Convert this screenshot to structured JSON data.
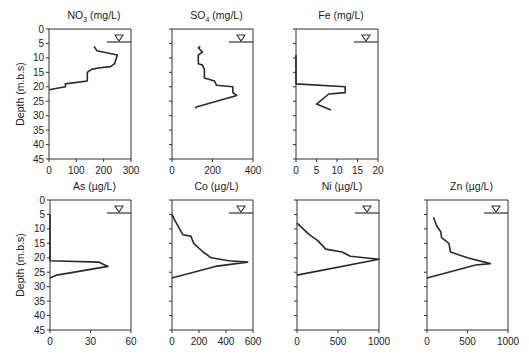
{
  "figure": {
    "ylabel": "Depth (m.b.s)",
    "y_ticks": [
      0,
      5,
      10,
      15,
      20,
      25,
      30,
      35,
      40,
      45
    ],
    "water_table_depth": 4.5
  },
  "chart_data": [
    {
      "type": "line",
      "title": "NO3 (mg/L)",
      "title_main": "NO",
      "title_sub": "3",
      "title_rest": " (mg/L)",
      "xlabel": "",
      "ylabel": "Depth (m.b.s)",
      "xlim": [
        0,
        300
      ],
      "ylim": [
        45,
        0
      ],
      "x_ticks": [
        0,
        100,
        200,
        300
      ],
      "y_ticks": [
        0,
        5,
        10,
        15,
        20,
        25,
        30,
        35,
        40,
        45
      ],
      "show_y_labels": true,
      "frame": {
        "x0": 49,
        "x1": 131,
        "y0": 29,
        "y1": 159
      },
      "points": [
        [
          165,
          6
        ],
        [
          175,
          7.5
        ],
        [
          250,
          9
        ],
        [
          240,
          12
        ],
        [
          225,
          13
        ],
        [
          180,
          13.5
        ],
        [
          155,
          14
        ],
        [
          140,
          15
        ],
        [
          140,
          18
        ],
        [
          60,
          19
        ],
        [
          60,
          20
        ],
        [
          0,
          21
        ]
      ]
    },
    {
      "type": "line",
      "title": "SO4 (mg/L)",
      "title_main": "SO",
      "title_sub": "4",
      "title_rest": " (mg/L)",
      "xlim": [
        0,
        400
      ],
      "ylim": [
        45,
        0
      ],
      "x_ticks": [
        0,
        200,
        400
      ],
      "y_ticks": [
        0,
        5,
        10,
        15,
        20,
        25,
        30,
        35,
        40,
        45
      ],
      "show_y_labels": false,
      "frame": {
        "x0": 172,
        "x1": 253,
        "y0": 29,
        "y1": 159
      },
      "points": [
        [
          140,
          6
        ],
        [
          130,
          6.5
        ],
        [
          150,
          8
        ],
        [
          130,
          9
        ],
        [
          130,
          12
        ],
        [
          150,
          12.5
        ],
        [
          160,
          14
        ],
        [
          160,
          17
        ],
        [
          210,
          18
        ],
        [
          220,
          19.5
        ],
        [
          300,
          20
        ],
        [
          300,
          22
        ],
        [
          320,
          23
        ],
        [
          120,
          27
        ],
        [
          115,
          27.5
        ]
      ]
    },
    {
      "type": "line",
      "title": "Fe (mg/L)",
      "title_main": "Fe (mg/L)",
      "title_sub": "",
      "title_rest": "",
      "xlim": [
        0,
        20
      ],
      "ylim": [
        45,
        0
      ],
      "x_ticks": [
        0,
        5,
        10,
        15,
        20
      ],
      "y_ticks": [
        0,
        5,
        10,
        15,
        20,
        25,
        30,
        35,
        40,
        45
      ],
      "show_y_labels": false,
      "frame": {
        "x0": 296,
        "x1": 378,
        "y0": 29,
        "y1": 159
      },
      "points": [
        [
          0,
          9
        ],
        [
          0,
          19
        ],
        [
          12,
          20
        ],
        [
          12,
          22
        ],
        [
          8,
          22.5
        ],
        [
          5,
          26
        ],
        [
          8.5,
          28
        ]
      ]
    },
    {
      "type": "line",
      "title": "As (µg/L)",
      "title_main": "As (µg/L)",
      "title_sub": "",
      "title_rest": "",
      "xlim": [
        0,
        60
      ],
      "ylim": [
        45,
        0
      ],
      "x_ticks": [
        0,
        30,
        60
      ],
      "y_ticks": [
        0,
        5,
        10,
        15,
        20,
        25,
        30,
        35,
        40,
        45
      ],
      "show_y_labels": true,
      "frame": {
        "x0": 50,
        "x1": 131,
        "y0": 200,
        "y1": 330
      },
      "points": [
        [
          0,
          5
        ],
        [
          0,
          21
        ],
        [
          36,
          21.5
        ],
        [
          43,
          23
        ],
        [
          5,
          26
        ],
        [
          0,
          27
        ]
      ]
    },
    {
      "type": "line",
      "title": "Co (µg/L)",
      "title_main": "Co (µg/L)",
      "title_sub": "",
      "title_rest": "",
      "xlim": [
        0,
        600
      ],
      "ylim": [
        45,
        0
      ],
      "x_ticks": [
        0,
        200,
        400,
        600
      ],
      "y_ticks": [
        0,
        5,
        10,
        15,
        20,
        25,
        30,
        35,
        40,
        45
      ],
      "show_y_labels": false,
      "frame": {
        "x0": 172,
        "x1": 253,
        "y0": 200,
        "y1": 330
      },
      "points": [
        [
          0,
          5
        ],
        [
          20,
          7
        ],
        [
          80,
          12
        ],
        [
          140,
          12.5
        ],
        [
          160,
          15
        ],
        [
          230,
          18
        ],
        [
          290,
          20
        ],
        [
          420,
          21
        ],
        [
          560,
          21.5
        ],
        [
          320,
          23
        ],
        [
          0,
          27
        ]
      ]
    },
    {
      "type": "line",
      "title": "Ni (µg/L)",
      "title_main": "Ni (µg/L)",
      "title_sub": "",
      "title_rest": "",
      "xlim": [
        0,
        1000
      ],
      "ylim": [
        45,
        0
      ],
      "x_ticks": [
        0,
        500,
        1000
      ],
      "y_ticks": [
        0,
        5,
        10,
        15,
        20,
        25,
        30,
        35,
        40,
        45
      ],
      "show_y_labels": false,
      "frame": {
        "x0": 297,
        "x1": 379,
        "y0": 200,
        "y1": 330
      },
      "points": [
        [
          0,
          8
        ],
        [
          150,
          12
        ],
        [
          250,
          14
        ],
        [
          350,
          17
        ],
        [
          550,
          18
        ],
        [
          650,
          19.5
        ],
        [
          1000,
          20.5
        ],
        [
          0,
          26
        ]
      ]
    },
    {
      "type": "line",
      "title": "Zn (µg/L)",
      "title_main": "Zn (µg/L)",
      "title_sub": "",
      "title_rest": "",
      "xlim": [
        0,
        1000
      ],
      "ylim": [
        45,
        0
      ],
      "x_ticks": [
        0,
        500,
        1000
      ],
      "y_ticks": [
        0,
        5,
        10,
        15,
        20,
        25,
        30,
        35,
        40,
        45
      ],
      "show_y_labels": false,
      "frame": {
        "x0": 427,
        "x1": 508,
        "y0": 200,
        "y1": 330
      },
      "points": [
        [
          80,
          6
        ],
        [
          120,
          9
        ],
        [
          170,
          11
        ],
        [
          180,
          13
        ],
        [
          270,
          15
        ],
        [
          290,
          18
        ],
        [
          500,
          20
        ],
        [
          780,
          22
        ],
        [
          600,
          22.5
        ],
        [
          0,
          27
        ]
      ]
    }
  ]
}
